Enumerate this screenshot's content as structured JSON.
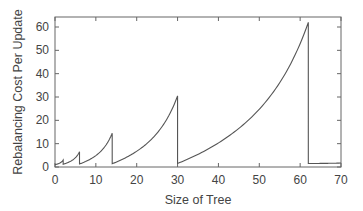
{
  "chart_data": {
    "type": "line",
    "title": "",
    "xlabel": "Size of Tree",
    "ylabel": "Rebalancing Cost Per Update",
    "xlim": [
      0,
      70
    ],
    "ylim": [
      0,
      65
    ],
    "xticks": [
      0,
      10,
      20,
      30,
      40,
      50,
      60,
      70
    ],
    "yticks": [
      0,
      10,
      20,
      30,
      40,
      50,
      60
    ],
    "grid": false,
    "legend": null,
    "series": [
      {
        "name": "rebalancing cost",
        "color": "#555555",
        "segments": [
          {
            "x_start": 0,
            "x_end": 2,
            "y_start": 1.0,
            "y_peak": 3.0
          },
          {
            "x_start": 2,
            "x_end": 6,
            "y_start": 1.2,
            "y_peak": 6.5
          },
          {
            "x_start": 6,
            "x_end": 14,
            "y_start": 1.3,
            "y_peak": 14.5
          },
          {
            "x_start": 14,
            "x_end": 30,
            "y_start": 1.4,
            "y_peak": 30.5
          },
          {
            "x_start": 30,
            "x_end": 62,
            "y_start": 1.5,
            "y_peak": 62.0
          },
          {
            "x_start": 62,
            "x_end": 70,
            "y_start": 1.5,
            "y_peak": 1.7
          }
        ]
      }
    ]
  }
}
